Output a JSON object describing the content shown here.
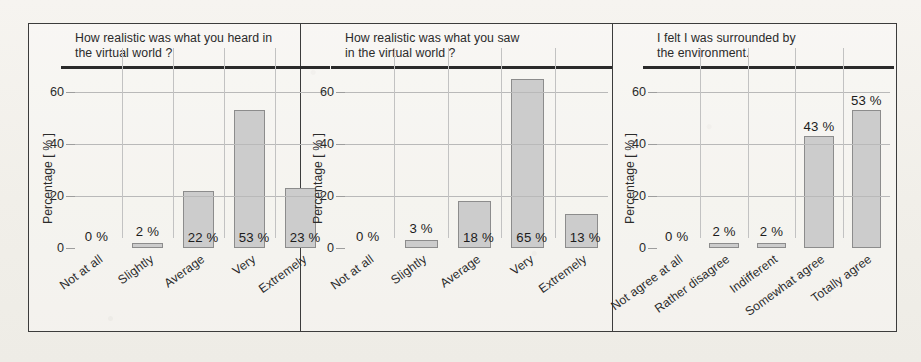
{
  "figure": {
    "y_axis_label": "Percentage [ % ]",
    "y_ticks": [
      "0",
      "20",
      "40",
      "60"
    ],
    "y_tick_values": [
      0,
      20,
      40,
      60
    ],
    "ylim": [
      0,
      70
    ],
    "bar_fill_color": "#cccccc",
    "bar_stroke_color": "#8c8c8c",
    "background_color": "#f4f2ee",
    "border_color": "#3c3c3c"
  },
  "chart_data": [
    {
      "type": "bar",
      "title": "How realistic was what you heard in\nthe virtual world ?",
      "categories": [
        "Not at all",
        "Slightly",
        "Average",
        "Very",
        "Extremely"
      ],
      "values": [
        0,
        2,
        22,
        53,
        23
      ],
      "labels": [
        "0 %",
        "2 %",
        "22 %",
        "53 %",
        "23 %"
      ],
      "xlabel": "",
      "ylabel": "Percentage [ % ]",
      "ylim": [
        0,
        70
      ],
      "yticks": [
        0,
        20,
        40,
        60
      ],
      "grid": true,
      "legend": "none",
      "label_placement": [
        "float",
        "float",
        "inside",
        "inside",
        "inside"
      ]
    },
    {
      "type": "bar",
      "title": "How realistic was what you saw\nin the virtual world ?",
      "categories": [
        "Not at all",
        "Slightly",
        "Average",
        "Very",
        "Extremely"
      ],
      "values": [
        0,
        3,
        18,
        65,
        13
      ],
      "labels": [
        "0 %",
        "3 %",
        "18 %",
        "65 %",
        "13 %"
      ],
      "xlabel": "",
      "ylabel": "Percentage [ % ]",
      "ylim": [
        0,
        70
      ],
      "yticks": [
        0,
        20,
        40,
        60
      ],
      "grid": true,
      "legend": "none",
      "label_placement": [
        "float",
        "float",
        "inside",
        "inside",
        "inside"
      ]
    },
    {
      "type": "bar",
      "title": "I felt I was surrounded by\nthe environment.",
      "categories": [
        "Not agree at all",
        "Rather disagree",
        "Indifferent",
        "Somewhat agree",
        "Totally agree"
      ],
      "values": [
        0,
        2,
        2,
        43,
        53
      ],
      "labels": [
        "0 %",
        "2 %",
        "2 %",
        "43 %",
        "53 %"
      ],
      "xlabel": "",
      "ylabel": "Percentage [ % ]",
      "ylim": [
        0,
        70
      ],
      "yticks": [
        0,
        20,
        40,
        60
      ],
      "grid": true,
      "legend": "none",
      "label_placement": [
        "float",
        "float",
        "float",
        "above",
        "above"
      ]
    }
  ]
}
